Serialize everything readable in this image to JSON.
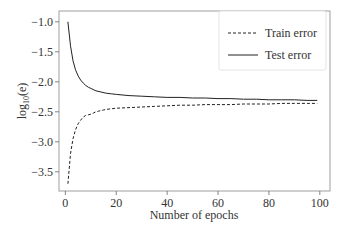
{
  "chart_data": {
    "type": "line",
    "title": "",
    "xlabel": "Number of epochs",
    "ylabel": "log10(e)",
    "ylabel_display": {
      "base": "log",
      "sub": "10",
      "arg": "(e)"
    },
    "xlim": [
      -2.5,
      104
    ],
    "ylim": [
      -3.82,
      -0.82
    ],
    "xticks": [
      0,
      20,
      40,
      60,
      80,
      100
    ],
    "yticks": [
      -1.0,
      -1.5,
      -2.0,
      -2.5,
      -3.0,
      -3.5
    ],
    "xtick_labels": [
      "0",
      "20",
      "40",
      "60",
      "80",
      "100"
    ],
    "ytick_labels": [
      "-1.0",
      "-1.5",
      "-2.0",
      "-2.5",
      "-3.0",
      "-3.5"
    ],
    "grid": false,
    "legend_position": "upper right",
    "series": [
      {
        "name": "Train error",
        "style": "dashed",
        "color": "#222222",
        "x": [
          1,
          2,
          3,
          4,
          5,
          6,
          7,
          8,
          9,
          10,
          11,
          12,
          13,
          14,
          15,
          16,
          18,
          20,
          25,
          30,
          35,
          40,
          45,
          50,
          55,
          60,
          65,
          70,
          75,
          80,
          85,
          90,
          95,
          99
        ],
        "y": [
          -3.7,
          -3.2,
          -2.95,
          -2.8,
          -2.7,
          -2.64,
          -2.59,
          -2.56,
          -2.55,
          -2.54,
          -2.52,
          -2.5,
          -2.49,
          -2.48,
          -2.47,
          -2.46,
          -2.45,
          -2.44,
          -2.43,
          -2.42,
          -2.41,
          -2.4,
          -2.39,
          -2.39,
          -2.38,
          -2.38,
          -2.38,
          -2.37,
          -2.37,
          -2.37,
          -2.36,
          -2.36,
          -2.36,
          -2.36
        ]
      },
      {
        "name": "Test error",
        "style": "solid",
        "color": "#222222",
        "x": [
          1,
          2,
          3,
          4,
          5,
          6,
          7,
          8,
          9,
          10,
          12,
          14,
          16,
          18,
          20,
          25,
          30,
          35,
          40,
          45,
          50,
          55,
          60,
          65,
          70,
          75,
          80,
          85,
          90,
          95,
          99
        ],
        "y": [
          -1.0,
          -1.4,
          -1.65,
          -1.8,
          -1.9,
          -1.97,
          -2.02,
          -2.06,
          -2.09,
          -2.11,
          -2.15,
          -2.17,
          -2.19,
          -2.2,
          -2.21,
          -2.23,
          -2.24,
          -2.25,
          -2.26,
          -2.26,
          -2.27,
          -2.27,
          -2.28,
          -2.28,
          -2.29,
          -2.29,
          -2.3,
          -2.3,
          -2.3,
          -2.31,
          -2.31
        ]
      }
    ]
  },
  "legend": {
    "items": [
      {
        "label": "Train error",
        "style": "dashed"
      },
      {
        "label": "Test error",
        "style": "solid"
      }
    ]
  }
}
